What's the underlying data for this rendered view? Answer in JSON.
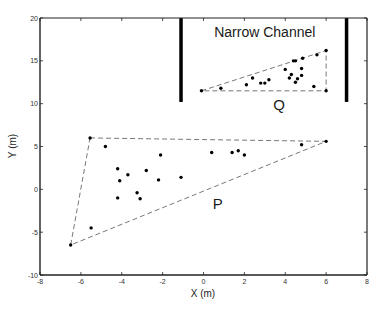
{
  "chart_data": {
    "type": "scatter",
    "title": "",
    "xlabel": "X (m)",
    "ylabel": "Y (m)",
    "xlim": [
      -8,
      8
    ],
    "ylim": [
      -10,
      20
    ],
    "xticks": [
      -8,
      -6,
      -4,
      -2,
      0,
      2,
      4,
      6,
      8
    ],
    "yticks": [
      -10,
      -5,
      0,
      5,
      10,
      15,
      20
    ],
    "grid": false,
    "legend": null,
    "annotations": [
      {
        "text": "Narrow Channel",
        "x": 3.0,
        "y": 17.8
      },
      {
        "text": "Q",
        "x": 3.7,
        "y": 9.3
      },
      {
        "text": "P",
        "x": 0.7,
        "y": -2.3
      }
    ],
    "walls": [
      {
        "name": "left-wall",
        "x": -1.1,
        "y_from": 10.2,
        "y_to": 20
      },
      {
        "name": "right-wall",
        "x": 7.0,
        "y_from": 10.2,
        "y_to": 20
      }
    ],
    "series": [
      {
        "name": "P",
        "hull": [
          [
            -5.55,
            6.0
          ],
          [
            6.0,
            5.6
          ],
          [
            -6.5,
            -6.5
          ]
        ],
        "points": [
          [
            -5.55,
            6.0
          ],
          [
            -4.8,
            5.0
          ],
          [
            -4.2,
            2.4
          ],
          [
            -4.1,
            1.0
          ],
          [
            -3.7,
            1.7
          ],
          [
            -2.8,
            2.2
          ],
          [
            -2.1,
            4.0
          ],
          [
            -2.2,
            1.1
          ],
          [
            -1.1,
            1.4
          ],
          [
            -4.2,
            -1.0
          ],
          [
            -3.25,
            -0.4
          ],
          [
            -3.1,
            -1.1
          ],
          [
            -5.5,
            -4.5
          ],
          [
            -6.5,
            -6.5
          ],
          [
            0.4,
            4.3
          ],
          [
            1.4,
            4.3
          ],
          [
            1.7,
            4.5
          ],
          [
            2.0,
            4.0
          ],
          [
            4.8,
            5.2
          ],
          [
            6.0,
            5.6
          ]
        ]
      },
      {
        "name": "Q",
        "hull": [
          [
            -0.1,
            11.5
          ],
          [
            6.0,
            16.2
          ],
          [
            6.0,
            11.5
          ]
        ],
        "points": [
          [
            -0.1,
            11.5
          ],
          [
            0.85,
            11.8
          ],
          [
            2.1,
            12.2
          ],
          [
            2.4,
            13.0
          ],
          [
            2.8,
            12.4
          ],
          [
            3.0,
            12.4
          ],
          [
            3.2,
            12.8
          ],
          [
            4.0,
            14.0
          ],
          [
            4.2,
            13.0
          ],
          [
            4.3,
            13.4
          ],
          [
            4.5,
            12.5
          ],
          [
            4.6,
            12.9
          ],
          [
            4.4,
            15.0
          ],
          [
            4.5,
            15.0
          ],
          [
            4.8,
            14.1
          ],
          [
            4.8,
            13.3
          ],
          [
            4.85,
            15.3
          ],
          [
            5.4,
            12.0
          ],
          [
            5.55,
            15.7
          ],
          [
            6.0,
            16.2
          ],
          [
            6.0,
            11.5
          ]
        ]
      }
    ]
  },
  "colors": {
    "axis": "#222222",
    "points": "#000000",
    "hull": "#555555",
    "wall": "#000000"
  }
}
